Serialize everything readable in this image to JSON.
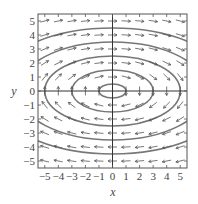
{
  "chart_data": {
    "type": "direction-field",
    "title": "",
    "xlabel": "x",
    "ylabel": "y",
    "xlim": [
      -5.5,
      5.5
    ],
    "ylim": [
      -5.5,
      5.5
    ],
    "x_ticks": [
      "-5",
      "-4",
      "-3",
      "-2",
      "-1",
      "0",
      "1",
      "2",
      "3",
      "4",
      "5"
    ],
    "y_ticks": [
      "5",
      "4",
      "3",
      "2",
      "1",
      "0",
      "-1",
      "-2",
      "-3",
      "-4",
      "-5"
    ],
    "grid": false,
    "field": "dx/dt = y, dy/dt = -x/4 (clockwise elliptical orbits)",
    "arrow_grid": {
      "x_from": -5,
      "x_to": 5,
      "y_from": -5,
      "y_to": 5,
      "step": 1
    },
    "solution_curves": [
      {
        "a": 1.0,
        "b": 0.5
      },
      {
        "a": 3.0,
        "b": 1.5
      },
      {
        "a": 5.0,
        "b": 2.5
      },
      {
        "a": 7.0,
        "b": 3.5
      },
      {
        "a": 9.0,
        "b": 4.5
      }
    ],
    "colors": {
      "curve": "#777777",
      "arrow": "#555555",
      "axis": "#333333",
      "frame": "#555555"
    }
  }
}
